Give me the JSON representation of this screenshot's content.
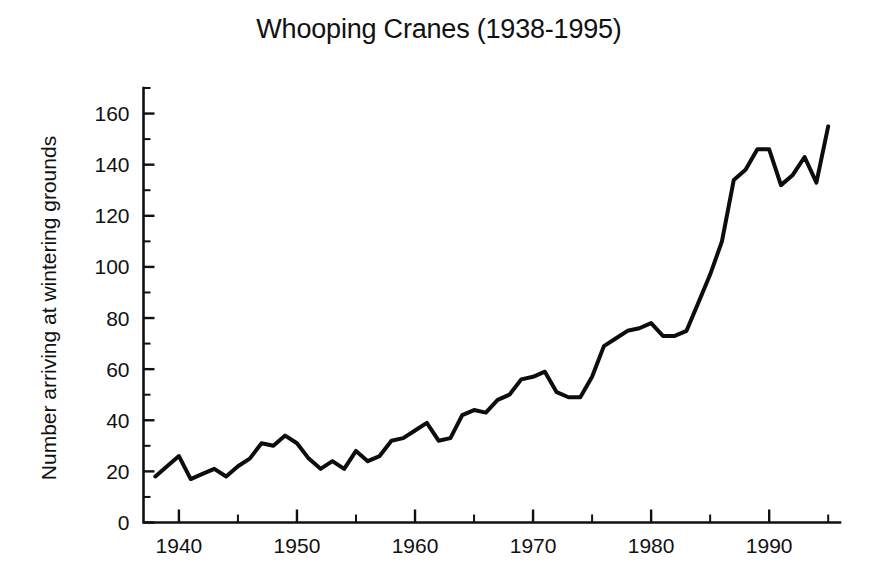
{
  "chart_data": {
    "type": "line",
    "title": "Whooping Cranes (1938-1995)",
    "xlabel": "",
    "ylabel": "Number arriving at wintering grounds",
    "xlim": [
      1937,
      1996
    ],
    "ylim": [
      0,
      170
    ],
    "grid": false,
    "legend": null,
    "x_ticks": [
      1940,
      1950,
      1960,
      1970,
      1980,
      1990
    ],
    "x_tick_labels": [
      "1940",
      "1950",
      "1960",
      "1970",
      "1980",
      "1990"
    ],
    "x_minor_tick_interval": 5,
    "y_ticks": [
      0,
      20,
      40,
      60,
      80,
      100,
      120,
      140,
      160
    ],
    "y_tick_labels": [
      "0",
      "20",
      "40",
      "60",
      "80",
      "100",
      "120",
      "140",
      "160"
    ],
    "y_minor_tick_interval": 10,
    "series": [
      {
        "name": "Whooping crane count",
        "x": [
          1938,
          1939,
          1940,
          1941,
          1942,
          1943,
          1944,
          1945,
          1946,
          1947,
          1948,
          1949,
          1950,
          1951,
          1952,
          1953,
          1954,
          1955,
          1956,
          1957,
          1958,
          1959,
          1960,
          1961,
          1962,
          1963,
          1964,
          1965,
          1966,
          1967,
          1968,
          1969,
          1970,
          1971,
          1972,
          1973,
          1974,
          1975,
          1976,
          1977,
          1978,
          1979,
          1980,
          1981,
          1982,
          1983,
          1984,
          1985,
          1986,
          1987,
          1988,
          1989,
          1990,
          1991,
          1992,
          1993,
          1994,
          1995
        ],
        "values": [
          18,
          22,
          26,
          17,
          19,
          21,
          18,
          22,
          25,
          31,
          30,
          34,
          31,
          25,
          21,
          24,
          21,
          28,
          24,
          26,
          32,
          33,
          36,
          39,
          32,
          33,
          42,
          44,
          43,
          48,
          50,
          56,
          57,
          59,
          51,
          49,
          49,
          57,
          69,
          72,
          75,
          76,
          78,
          73,
          73,
          75,
          86,
          97,
          110,
          134,
          138,
          146,
          146,
          132,
          136,
          143,
          133,
          155
        ]
      }
    ]
  },
  "axis": {
    "tick_color": "#111111",
    "line_color": "#111111",
    "series_color": "#0d0d0d"
  }
}
